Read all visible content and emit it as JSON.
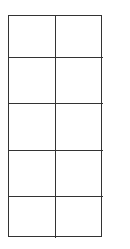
{
  "diagram": {
    "type": "empty-grid",
    "rows": 5,
    "columns": 2,
    "line_color": "#333333",
    "background": "#ffffff",
    "cells": [
      [
        "",
        ""
      ],
      [
        "",
        ""
      ],
      [
        "",
        ""
      ],
      [
        "",
        ""
      ],
      [
        "",
        ""
      ]
    ]
  }
}
